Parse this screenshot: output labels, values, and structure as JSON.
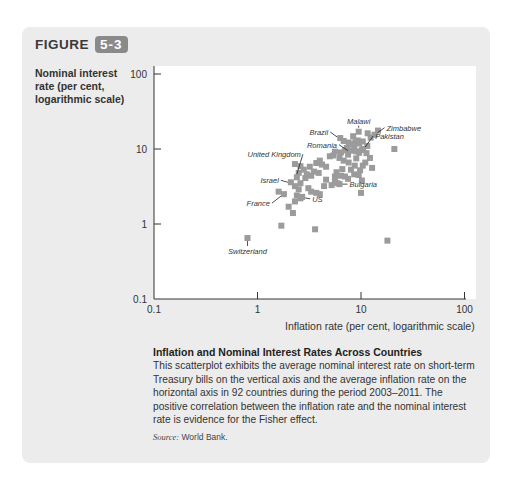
{
  "figure": {
    "label": "FIGURE",
    "number": "5-3"
  },
  "axes": {
    "ylabel": "Nominal interest rate (per cent, logarithmic scale)",
    "xlabel": "Inflation rate (per cent, logarithmic scale)"
  },
  "caption": {
    "title": "Inflation and Nominal Interest Rates Across Countries",
    "body": "This scatterplot exhibits the average nominal interest rate on short-term Treasury bills on the vertical axis and the average inflation rate on the horizontal axis in 92 countries during the period 2003–2011. The positive correlation between the inflation rate and the nominal interest rate is evidence for the Fisher effect.",
    "source_label": "Source:",
    "source_value": "World Bank."
  },
  "colors": {
    "point": "#9b9b9b",
    "panel": "#ececec",
    "badge": "#8a8a8a"
  },
  "chart_data": {
    "type": "scatter",
    "title": "Inflation and Nominal Interest Rates Across Countries",
    "xlabel": "Inflation rate (per cent, logarithmic scale)",
    "ylabel": "Nominal interest rate (per cent, logarithmic scale)",
    "xscale": "log",
    "yscale": "log",
    "xlim": [
      0.1,
      100
    ],
    "ylim": [
      0.1,
      100
    ],
    "xticks": [
      "0.1",
      "1",
      "10",
      "100"
    ],
    "yticks": [
      "0.1",
      "1",
      "10",
      "100"
    ],
    "grid": false,
    "legend": null,
    "n_countries": 92,
    "labeled_points": [
      {
        "name": "Malawi",
        "x": 9.5,
        "y": 17
      },
      {
        "name": "Zimbabwe",
        "x": 13.5,
        "y": 15.5
      },
      {
        "name": "Pakistan",
        "x": 10.5,
        "y": 10
      },
      {
        "name": "Brazil",
        "x": 6.3,
        "y": 14
      },
      {
        "name": "Romania",
        "x": 8.0,
        "y": 9.5
      },
      {
        "name": "United Kingdom",
        "x": 2.4,
        "y": 4.2
      },
      {
        "name": "Israel",
        "x": 2.1,
        "y": 3.6
      },
      {
        "name": "France",
        "x": 1.8,
        "y": 2.5
      },
      {
        "name": "US",
        "x": 2.7,
        "y": 2.3
      },
      {
        "name": "Bulgaria",
        "x": 6.2,
        "y": 3.4
      },
      {
        "name": "Switzerland",
        "x": 0.8,
        "y": 0.65
      }
    ],
    "points": [
      [
        0.8,
        0.65
      ],
      [
        1.6,
        2.7
      ],
      [
        1.8,
        2.5
      ],
      [
        1.7,
        0.95
      ],
      [
        2.2,
        1.4
      ],
      [
        2.3,
        2.0
      ],
      [
        2.4,
        2.4
      ],
      [
        2.6,
        2.2
      ],
      [
        2.7,
        2.3
      ],
      [
        2.5,
        2.9
      ],
      [
        2.3,
        3.2
      ],
      [
        2.1,
        3.6
      ],
      [
        2.6,
        3.5
      ],
      [
        2.4,
        4.2
      ],
      [
        2.5,
        4.8
      ],
      [
        2.8,
        5.3
      ],
      [
        2.6,
        5.9
      ],
      [
        2.3,
        6.3
      ],
      [
        2.9,
        4.1
      ],
      [
        3.1,
        3.0
      ],
      [
        3.3,
        2.7
      ],
      [
        3.7,
        2.6
      ],
      [
        4.0,
        2.5
      ],
      [
        3.6,
        0.85
      ],
      [
        3.0,
        4.6
      ],
      [
        3.2,
        5.8
      ],
      [
        3.5,
        5.0
      ],
      [
        3.9,
        4.8
      ],
      [
        4.2,
        6.2
      ],
      [
        4.6,
        5.8
      ],
      [
        4.0,
        7.0
      ],
      [
        3.7,
        6.5
      ],
      [
        4.6,
        3.9
      ],
      [
        5.2,
        3.3
      ],
      [
        5.6,
        3.7
      ],
      [
        5.9,
        3.5
      ],
      [
        6.2,
        3.4
      ],
      [
        5.6,
        4.3
      ],
      [
        5.8,
        4.9
      ],
      [
        6.4,
        4.4
      ],
      [
        7.0,
        4.3
      ],
      [
        7.5,
        4.0
      ],
      [
        8.0,
        5.3
      ],
      [
        8.6,
        4.6
      ],
      [
        9.5,
        4.5
      ],
      [
        10.2,
        3.8
      ],
      [
        9.8,
        5.2
      ],
      [
        10.4,
        6.0
      ],
      [
        8.7,
        6.0
      ],
      [
        7.6,
        6.6
      ],
      [
        6.8,
        7.0
      ],
      [
        6.2,
        7.6
      ],
      [
        5.4,
        8.2
      ],
      [
        5.0,
        8.0
      ],
      [
        5.6,
        9.2
      ],
      [
        6.4,
        9.0
      ],
      [
        7.0,
        9.6
      ],
      [
        7.5,
        8.4
      ],
      [
        8.0,
        9.5
      ],
      [
        8.6,
        10.6
      ],
      [
        9.0,
        9.3
      ],
      [
        9.6,
        8.9
      ],
      [
        10.2,
        9.7
      ],
      [
        10.5,
        10.0
      ],
      [
        11.3,
        8.8
      ],
      [
        12.2,
        7.6
      ],
      [
        11.5,
        11.0
      ],
      [
        9.6,
        11.8
      ],
      [
        8.8,
        12.3
      ],
      [
        9.3,
        13.0
      ],
      [
        10.4,
        12.6
      ],
      [
        6.3,
        14.0
      ],
      [
        6.8,
        12.8
      ],
      [
        7.6,
        12.2
      ],
      [
        12.4,
        14.2
      ],
      [
        13.5,
        15.5
      ],
      [
        14.6,
        17.6
      ],
      [
        9.5,
        17.0
      ],
      [
        11.6,
        16.2
      ],
      [
        21.0,
        10.0
      ],
      [
        18.0,
        0.6
      ],
      [
        8.2,
        11.5
      ],
      [
        7.3,
        10.3
      ],
      [
        9.0,
        7.5
      ],
      [
        11.0,
        6.6
      ],
      [
        12.8,
        5.6
      ],
      [
        10.0,
        2.6
      ],
      [
        4.4,
        3.2
      ],
      [
        2.0,
        1.7
      ],
      [
        3.3,
        4.4
      ],
      [
        8.4,
        14.8
      ],
      [
        6.6,
        5.4
      ]
    ]
  }
}
